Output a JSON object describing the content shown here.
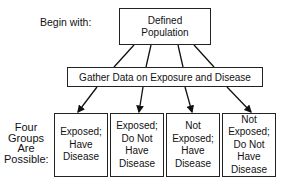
{
  "begin_label": "Begin with:",
  "top_box": {
    "line1": "Defined",
    "line2": "Population"
  },
  "middle_box": "Gather Data on Exposure and Disease",
  "groups_label": {
    "lines": [
      "Four",
      "Groups",
      "Are",
      "Possible:"
    ]
  },
  "groups": [
    {
      "lines": [
        "Exposed;",
        "Have",
        "Disease"
      ]
    },
    {
      "lines": [
        "Exposed;",
        "Do Not",
        "Have",
        "Disease"
      ]
    },
    {
      "lines": [
        "Not",
        "Exposed;",
        "Have",
        "Disease"
      ]
    },
    {
      "lines": [
        "Not",
        "Exposed;",
        "Do Not",
        "Have",
        "Disease"
      ]
    }
  ]
}
